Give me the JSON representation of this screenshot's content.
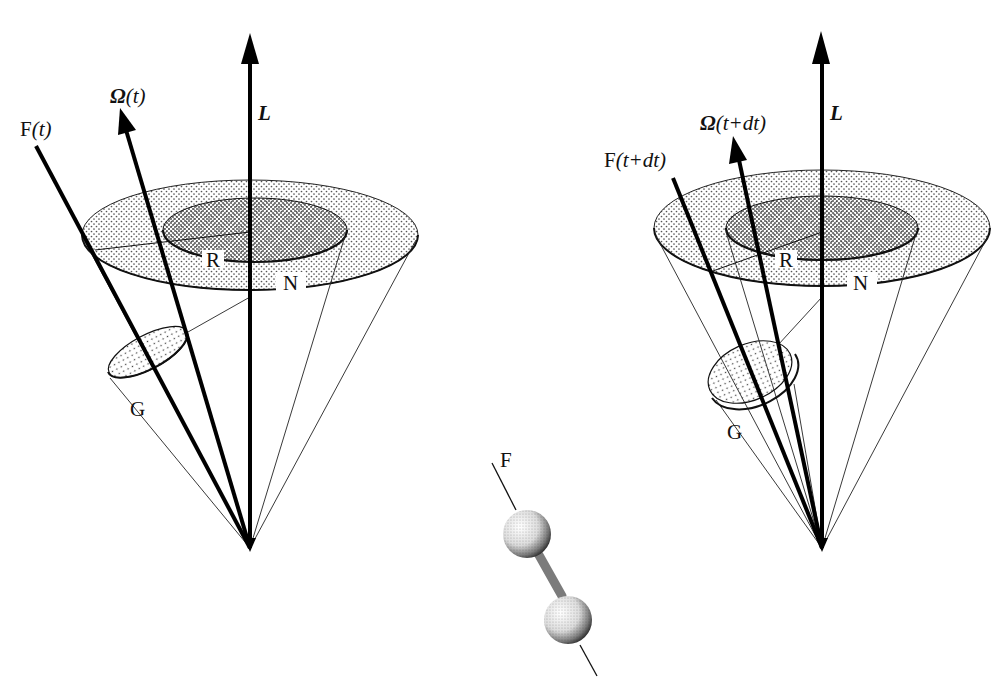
{
  "figure": {
    "colors": {
      "ink": "#111111",
      "background": "#ffffff",
      "stipple": "#555555"
    }
  },
  "left_panel": {
    "time_label": "t",
    "vectors": {
      "L": {
        "label": "L"
      },
      "Omega": {
        "label_symbol": "Ω",
        "label_arg": "(t)"
      },
      "F": {
        "label_symbol": "F",
        "label_arg": "(t)"
      }
    },
    "cones": {
      "N": {
        "label": "N"
      },
      "R": {
        "label": "R"
      },
      "G": {
        "label": "G"
      }
    }
  },
  "right_panel": {
    "time_label": "t+dt",
    "vectors": {
      "L": {
        "label": "L"
      },
      "Omega": {
        "label_symbol": "Ω",
        "label_arg": "(t+dt)"
      },
      "F": {
        "label_symbol": "F",
        "label_arg": "(t+dt)"
      }
    },
    "cones": {
      "N": {
        "label": "N"
      },
      "R": {
        "label": "R"
      },
      "G": {
        "label": "G"
      }
    }
  },
  "molecule": {
    "axis_label": "F",
    "type": "dumbbell"
  }
}
